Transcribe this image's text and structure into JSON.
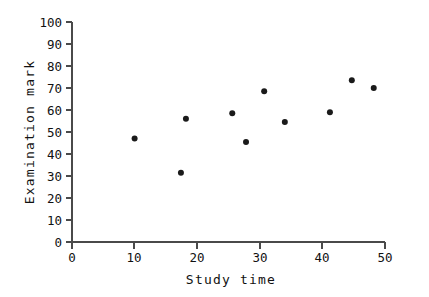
{
  "chart_data": {
    "type": "scatter",
    "title": "",
    "xlabel": "Study time",
    "ylabel": "Examination mark",
    "xlim": [
      0,
      50
    ],
    "ylim": [
      0,
      100
    ],
    "xticks": [
      0,
      10,
      20,
      30,
      40,
      50
    ],
    "yticks": [
      0,
      10,
      20,
      30,
      40,
      50,
      60,
      70,
      80,
      90,
      100
    ],
    "xtick_labels": [
      "0",
      "10",
      "20",
      "30",
      "40",
      "50"
    ],
    "ytick_labels": [
      "0",
      "10",
      "20",
      "30",
      "40",
      "50",
      "60",
      "70",
      "80",
      "90",
      "100"
    ],
    "grid": false,
    "legend": null,
    "marker": "filled-circle",
    "marker_color": "#1a1a1a",
    "points": [
      {
        "x": 10,
        "y": 47
      },
      {
        "x": 17.4,
        "y": 31.5
      },
      {
        "x": 18.2,
        "y": 56
      },
      {
        "x": 25.6,
        "y": 58.5
      },
      {
        "x": 27.8,
        "y": 45.5
      },
      {
        "x": 30.7,
        "y": 68.5
      },
      {
        "x": 34,
        "y": 54.5
      },
      {
        "x": 41.2,
        "y": 59
      },
      {
        "x": 44.7,
        "y": 73.5
      },
      {
        "x": 48.2,
        "y": 70
      }
    ],
    "series": [
      {
        "name": "observations",
        "x": [
          10,
          17.4,
          18.2,
          25.6,
          27.8,
          30.7,
          34,
          41.2,
          44.7,
          48.2
        ],
        "values": [
          47,
          31.5,
          56,
          58.5,
          45.5,
          68.5,
          54.5,
          59,
          73.5,
          70
        ]
      }
    ]
  },
  "axes": {
    "x_title": "Study time",
    "y_title": "Examination mark"
  }
}
